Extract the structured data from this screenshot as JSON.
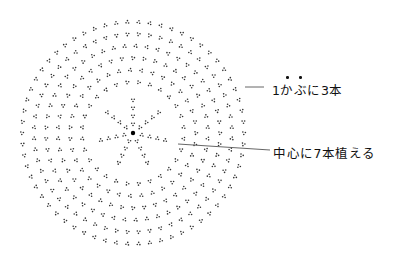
{
  "diagram": {
    "center": {
      "x": 133,
      "y": 133
    },
    "ring_radii": [
      15,
      27,
      39,
      51,
      63,
      75,
      87,
      99,
      111
    ],
    "ring_counts": [
      7,
      14,
      21,
      28,
      35,
      42,
      49,
      56,
      62
    ],
    "spokes": 7,
    "colors": {
      "dot": "#333333",
      "center": "#000000",
      "leader": "#555555"
    }
  },
  "labels": {
    "per_hill": {
      "prefix": "1",
      "emph1": "か",
      "emph2": "ぶ",
      "suffix": "に3本",
      "full": "1かぶに3本",
      "emphasis_dots_on": [
        "か",
        "ぶ"
      ]
    },
    "center": {
      "text": "中心に7本植える"
    }
  }
}
